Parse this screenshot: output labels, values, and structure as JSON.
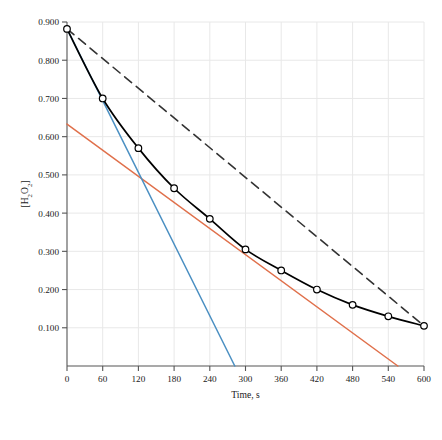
{
  "chart_data": {
    "type": "line",
    "title": "",
    "subtitle": "",
    "xlabel": "Time, s",
    "ylabel": "[H2O2]",
    "ylabel_parts": {
      "open": "[H",
      "sub1": "2",
      "mid": "O",
      "sub2": "2",
      "close": "]"
    },
    "xlim": [
      0,
      600
    ],
    "ylim": [
      0.0,
      0.9
    ],
    "xticks": [
      0,
      60,
      120,
      180,
      240,
      300,
      360,
      420,
      480,
      540,
      600
    ],
    "xtick_labels": [
      "0",
      "60",
      "120",
      "180",
      "240",
      "300",
      "360",
      "420",
      "480",
      "540",
      "600"
    ],
    "yticks": [
      0.1,
      0.2,
      0.3,
      0.4,
      0.5,
      0.6,
      0.7,
      0.8,
      0.9
    ],
    "ytick_labels": [
      "0.100",
      "0.200",
      "0.300",
      "0.400",
      "0.500",
      "0.600",
      "0.700",
      "0.800",
      "0.900"
    ],
    "grid": true,
    "grid_color": "#e8e8e8",
    "legend": "none",
    "series": [
      {
        "name": "concentration-data",
        "style": "solid-with-open-circle-markers",
        "color": "#000000",
        "marker": "open-circle",
        "x": [
          0,
          60,
          120,
          180,
          240,
          300,
          360,
          420,
          480,
          540,
          600
        ],
        "values": [
          0.882,
          0.7,
          0.57,
          0.465,
          0.385,
          0.305,
          0.25,
          0.2,
          0.16,
          0.13,
          0.105
        ]
      },
      {
        "name": "tangent-at-t0",
        "style": "solid",
        "color": "#4a8fc2",
        "x": [
          0,
          282
        ],
        "values": [
          0.882,
          0.0
        ]
      },
      {
        "name": "tangent-at-t300",
        "style": "solid",
        "color": "#e0704b",
        "x": [
          0,
          556
        ],
        "values": [
          0.633,
          0.0
        ]
      },
      {
        "name": "secant-0-to-600",
        "style": "dashed",
        "color": "#333333",
        "x": [
          0,
          600
        ],
        "values": [
          0.882,
          0.105
        ]
      }
    ],
    "annotations": []
  },
  "figure": {
    "background": "#ffffff",
    "axis_color": "#555555"
  }
}
